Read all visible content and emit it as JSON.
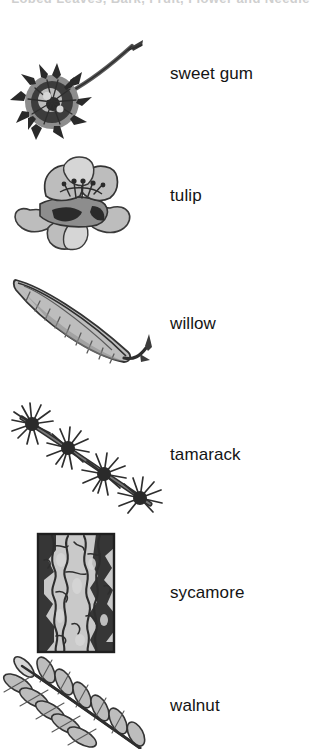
{
  "page": {
    "background_color": "#ffffff",
    "text_color": "#141414",
    "clipped_header_text": "Lobed Leaves, Bark, Fruit, Flower and Needle"
  },
  "rows": [
    {
      "label": "sweet gum",
      "illustration": "sweet-gum-seed-ball",
      "illustration_description": "spiky round seed ball on a long curved stalk"
    },
    {
      "label": "tulip",
      "illustration": "tulip-tree-flower",
      "illustration_description": "cup-shaped flower with spreading outer petals"
    },
    {
      "label": "willow",
      "illustration": "willow-leaf",
      "illustration_description": "long narrow lance-shaped leaf set on a diagonal"
    },
    {
      "label": "tamarack",
      "illustration": "tamarack-needle-branch",
      "illustration_description": "branch with four tufted clusters of needles"
    },
    {
      "label": "sycamore",
      "illustration": "sycamore-bark-patch",
      "illustration_description": "rectangular patch of mottled flaking bark"
    },
    {
      "label": "walnut",
      "illustration": "walnut-compound-leaf",
      "illustration_description": "pinnate compound leaf with paired leaflets, cropped at bottom"
    }
  ]
}
